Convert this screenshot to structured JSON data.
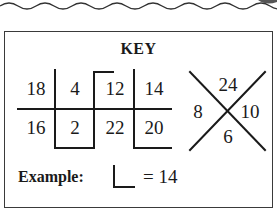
{
  "key": {
    "title": "KEY",
    "grid": {
      "top_row": [
        "18",
        "4",
        "12",
        "14"
      ],
      "bottom_row": [
        "16",
        "2",
        "22",
        "20"
      ]
    },
    "x_diagram": {
      "top": "24",
      "left": "8",
      "right": "10",
      "bottom": "6"
    },
    "example": {
      "label": "Example:",
      "equation": "= 14"
    }
  },
  "colors": {
    "line": "#1a1a1a",
    "border": "#3a3a3a",
    "background": "#ffffff"
  }
}
